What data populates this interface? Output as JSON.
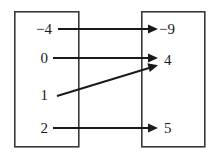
{
  "diagram": {
    "type": "mapping-diagram",
    "domain_set": {
      "name": "domain",
      "box": {
        "x": 14,
        "y": 11,
        "width": 65,
        "height": 136
      },
      "elements": [
        {
          "id": "d0",
          "label": "−4",
          "value": -4,
          "y": 29
        },
        {
          "id": "d1",
          "label": "0",
          "value": 0,
          "y": 58
        },
        {
          "id": "d2",
          "label": "1",
          "value": 1,
          "y": 95
        },
        {
          "id": "d3",
          "label": "2",
          "value": 2,
          "y": 128
        }
      ]
    },
    "range_set": {
      "name": "range",
      "box": {
        "x": 141,
        "y": 11,
        "width": 64,
        "height": 136
      },
      "elements": [
        {
          "id": "r0",
          "label": "−9",
          "value": -9,
          "y": 29
        },
        {
          "id": "r1",
          "label": "4",
          "value": 4,
          "y": 60
        },
        {
          "id": "r2",
          "label": "5",
          "value": 5,
          "y": 128
        }
      ]
    },
    "arrows": [
      {
        "id": "a0",
        "from": "d0",
        "to": "r0",
        "from_label": "−4",
        "to_label": "−9",
        "x1": 58,
        "y1": 29,
        "x2": 152,
        "y2": 29,
        "kind": "horizontal"
      },
      {
        "id": "a1",
        "from": "d1",
        "to": "r1",
        "from_label": "0",
        "to_label": "4",
        "x1": 53,
        "y1": 58,
        "x2": 152,
        "y2": 58,
        "kind": "horizontal"
      },
      {
        "id": "a2",
        "from": "d2",
        "to": "r1",
        "from_label": "1",
        "to_label": "4",
        "x1": 58,
        "y1": 95,
        "x2": 152,
        "y2": 66,
        "kind": "diagonal"
      },
      {
        "id": "a3",
        "from": "d3",
        "to": "r2",
        "from_label": "2",
        "to_label": "5",
        "x1": 53,
        "y1": 128,
        "x2": 152,
        "y2": 128,
        "kind": "horizontal"
      }
    ],
    "pairs": [
      {
        "input": -4,
        "output": -9
      },
      {
        "input": 0,
        "output": 4
      },
      {
        "input": 1,
        "output": 4
      },
      {
        "input": 2,
        "output": 5
      }
    ],
    "colors": {
      "background": "#ffffff",
      "box_stroke": "#3a3a3a",
      "line": "#1a1a1a",
      "text": "#1a1a1a"
    }
  }
}
